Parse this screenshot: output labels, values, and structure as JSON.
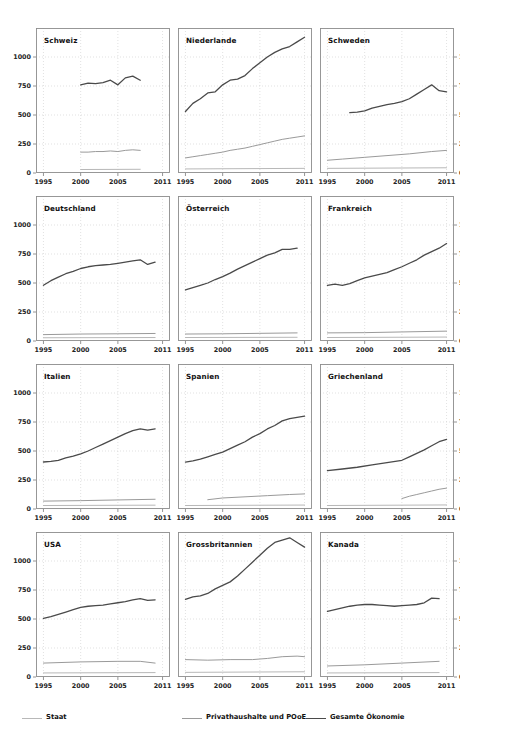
{
  "chart_data": {
    "type": "line",
    "title": "",
    "xlabel": "",
    "ylabel": "",
    "xlim": [
      1994,
      2012
    ],
    "ylim": [
      0,
      1250
    ],
    "xticks": [
      1995,
      2000,
      2005,
      2011
    ],
    "xtick_labels": [
      "1995",
      "2000",
      "2005",
      "2011"
    ],
    "yticks": [
      0,
      250,
      500,
      750,
      1000
    ],
    "ytick_labels": [
      "0",
      "250",
      "500",
      "750",
      "1000"
    ],
    "grid": true,
    "legend_position": "bottom",
    "series_names": [
      "Staat",
      "Privathaushalte und POoE",
      "Gesamte Ökonomie"
    ],
    "series_colors": [
      "#b8b8b8",
      "#9a9a9a",
      "#4a4a4a"
    ],
    "panels": [
      {
        "title": "Schweiz",
        "row": 0,
        "col": 0,
        "y_axis": "left",
        "series": [
          {
            "name": "Gesamte Ökonomie",
            "x": [
              2000,
              2001,
              2002,
              2003,
              2004,
              2005,
              2006,
              2007,
              2008
            ],
            "y": [
              760,
              775,
              770,
              780,
              800,
              760,
              820,
              835,
              800
            ]
          },
          {
            "name": "Privathaushalte und POoE",
            "x": [
              2000,
              2001,
              2002,
              2003,
              2004,
              2005,
              2006,
              2007,
              2008
            ],
            "y": [
              180,
              180,
              185,
              185,
              190,
              185,
              195,
              200,
              195
            ]
          },
          {
            "name": "Staat",
            "x": [
              2000,
              2008
            ],
            "y": [
              30,
              32
            ]
          }
        ]
      },
      {
        "title": "Niederlande",
        "row": 0,
        "col": 1,
        "y_axis": "none",
        "series": [
          {
            "name": "Gesamte Ökonomie",
            "x": [
              1995,
              1996,
              1997,
              1998,
              1999,
              2000,
              2001,
              2002,
              2003,
              2004,
              2005,
              2006,
              2007,
              2008,
              2009,
              2010,
              2011
            ],
            "y": [
              530,
              600,
              640,
              690,
              700,
              760,
              800,
              810,
              840,
              900,
              950,
              1000,
              1040,
              1070,
              1090,
              1130,
              1170
            ]
          },
          {
            "name": "Privathaushalte und POoE",
            "x": [
              1995,
              1996,
              1997,
              1998,
              1999,
              2000,
              2001,
              2002,
              2003,
              2004,
              2005,
              2006,
              2007,
              2008,
              2009,
              2010,
              2011
            ],
            "y": [
              130,
              140,
              150,
              160,
              170,
              180,
              195,
              205,
              215,
              230,
              245,
              260,
              275,
              290,
              300,
              310,
              320
            ]
          },
          {
            "name": "Staat",
            "x": [
              1995,
              2011
            ],
            "y": [
              35,
              40
            ]
          }
        ]
      },
      {
        "title": "Schweden",
        "row": 0,
        "col": 2,
        "y_axis": "right",
        "series": [
          {
            "name": "Gesamte Ökonomie",
            "x": [
              1998,
              1999,
              2000,
              2001,
              2002,
              2003,
              2004,
              2005,
              2006,
              2007,
              2008,
              2009,
              2010,
              2011
            ],
            "y": [
              520,
              525,
              535,
              560,
              575,
              590,
              600,
              615,
              640,
              680,
              720,
              760,
              710,
              700
            ]
          },
          {
            "name": "Privathaushalte und POoE",
            "x": [
              1995,
              1997,
              2000,
              2003,
              2006,
              2009,
              2011
            ],
            "y": [
              110,
              120,
              135,
              150,
              165,
              185,
              195
            ]
          },
          {
            "name": "Staat",
            "x": [
              1995,
              2011
            ],
            "y": [
              40,
              45
            ]
          }
        ]
      },
      {
        "title": "Deutschland",
        "row": 1,
        "col": 0,
        "y_axis": "left",
        "series": [
          {
            "name": "Gesamte Ökonomie",
            "x": [
              1995,
              1996,
              1997,
              1998,
              1999,
              2000,
              2001,
              2002,
              2003,
              2004,
              2005,
              2006,
              2007,
              2008,
              2009,
              2010
            ],
            "y": [
              480,
              520,
              550,
              580,
              600,
              625,
              640,
              650,
              655,
              660,
              670,
              680,
              690,
              700,
              660,
              680
            ]
          },
          {
            "name": "Privathaushalte und POoE",
            "x": [
              1995,
              2000,
              2005,
              2010
            ],
            "y": [
              55,
              60,
              62,
              65
            ]
          },
          {
            "name": "Staat",
            "x": [
              1995,
              2010
            ],
            "y": [
              28,
              30
            ]
          }
        ]
      },
      {
        "title": "Österreich",
        "row": 1,
        "col": 1,
        "y_axis": "none",
        "series": [
          {
            "name": "Gesamte Ökonomie",
            "x": [
              1995,
              1996,
              1997,
              1998,
              1999,
              2000,
              2001,
              2002,
              2003,
              2004,
              2005,
              2006,
              2007,
              2008,
              2009,
              2010
            ],
            "y": [
              440,
              460,
              480,
              500,
              530,
              555,
              585,
              620,
              650,
              680,
              710,
              740,
              760,
              790,
              790,
              800
            ]
          },
          {
            "name": "Privathaushalte und POoE",
            "x": [
              1995,
              2000,
              2005,
              2010
            ],
            "y": [
              60,
              62,
              66,
              70
            ]
          },
          {
            "name": "Staat",
            "x": [
              1995,
              2010
            ],
            "y": [
              30,
              32
            ]
          }
        ]
      },
      {
        "title": "Frankreich",
        "row": 1,
        "col": 2,
        "y_axis": "right",
        "series": [
          {
            "name": "Gesamte Ökonomie",
            "x": [
              1995,
              1996,
              1997,
              1998,
              1999,
              2000,
              2001,
              2002,
              2003,
              2004,
              2005,
              2006,
              2007,
              2008,
              2009,
              2010,
              2011
            ],
            "y": [
              480,
              490,
              480,
              495,
              520,
              545,
              560,
              575,
              590,
              615,
              640,
              670,
              700,
              740,
              770,
              800,
              840
            ]
          },
          {
            "name": "Privathaushalte und POoE",
            "x": [
              1995,
              2000,
              2005,
              2011
            ],
            "y": [
              70,
              72,
              78,
              85
            ]
          },
          {
            "name": "Staat",
            "x": [
              1995,
              2011
            ],
            "y": [
              30,
              34
            ]
          }
        ]
      },
      {
        "title": "Italien",
        "row": 2,
        "col": 0,
        "y_axis": "left",
        "series": [
          {
            "name": "Gesamte Ökonomie",
            "x": [
              1995,
              1996,
              1997,
              1998,
              1999,
              2000,
              2001,
              2002,
              2003,
              2004,
              2005,
              2006,
              2007,
              2008,
              2009,
              2010
            ],
            "y": [
              405,
              410,
              420,
              440,
              455,
              475,
              500,
              530,
              560,
              590,
              620,
              650,
              675,
              690,
              680,
              690
            ]
          },
          {
            "name": "Privathaushalte und POoE",
            "x": [
              1995,
              2000,
              2005,
              2010
            ],
            "y": [
              68,
              72,
              78,
              84
            ]
          },
          {
            "name": "Staat",
            "x": [
              1995,
              2010
            ],
            "y": [
              30,
              33
            ]
          }
        ]
      },
      {
        "title": "Spanien",
        "row": 2,
        "col": 1,
        "y_axis": "none",
        "series": [
          {
            "name": "Gesamte Ökonomie",
            "x": [
              1995,
              1996,
              1997,
              1998,
              1999,
              2000,
              2001,
              2002,
              2003,
              2004,
              2005,
              2006,
              2007,
              2008,
              2009,
              2010,
              2011
            ],
            "y": [
              405,
              415,
              430,
              450,
              470,
              490,
              520,
              550,
              580,
              620,
              650,
              690,
              720,
              760,
              780,
              790,
              800
            ]
          },
          {
            "name": "Privathaushalte und POoE",
            "x": [
              1998,
              2000,
              2003,
              2006,
              2009,
              2011
            ],
            "y": [
              80,
              95,
              105,
              115,
              125,
              130
            ]
          },
          {
            "name": "Staat",
            "x": [
              1995,
              2011
            ],
            "y": [
              30,
              34
            ]
          }
        ]
      },
      {
        "title": "Griechenland",
        "row": 2,
        "col": 2,
        "y_axis": "right",
        "series": [
          {
            "name": "Gesamte Ökonomie",
            "x": [
              1995,
              1997,
              1999,
              2001,
              2003,
              2005,
              2006,
              2007,
              2008,
              2009,
              2010,
              2011
            ],
            "y": [
              330,
              345,
              360,
              380,
              400,
              420,
              450,
              480,
              510,
              545,
              580,
              600
            ]
          },
          {
            "name": "Privathaushalte und POoE",
            "x": [
              2005,
              2006,
              2007,
              2008,
              2009,
              2010,
              2011
            ],
            "y": [
              90,
              110,
              125,
              140,
              155,
              170,
              180
            ]
          },
          {
            "name": "Staat",
            "x": [
              1995,
              2011
            ],
            "y": [
              30,
              35
            ]
          }
        ]
      },
      {
        "title": "USA",
        "row": 3,
        "col": 0,
        "y_axis": "left",
        "series": [
          {
            "name": "Gesamte Ökonomie",
            "x": [
              1995,
              1996,
              1997,
              1998,
              1999,
              2000,
              2001,
              2002,
              2003,
              2004,
              2005,
              2006,
              2007,
              2008,
              2009,
              2010
            ],
            "y": [
              505,
              520,
              540,
              560,
              580,
              600,
              610,
              615,
              620,
              630,
              640,
              650,
              665,
              675,
              660,
              665
            ]
          },
          {
            "name": "Privathaushalte und POoE",
            "x": [
              1995,
              2000,
              2005,
              2008,
              2010
            ],
            "y": [
              120,
              130,
              135,
              135,
              120
            ]
          },
          {
            "name": "Staat",
            "x": [
              1995,
              2010
            ],
            "y": [
              35,
              38
            ]
          }
        ]
      },
      {
        "title": "Grossbritannien",
        "row": 3,
        "col": 1,
        "y_axis": "none",
        "series": [
          {
            "name": "Gesamte Ökonomie",
            "x": [
              1995,
              1996,
              1997,
              1998,
              1999,
              2000,
              2001,
              2002,
              2003,
              2004,
              2005,
              2006,
              2007,
              2008,
              2009,
              2010,
              2011
            ],
            "y": [
              670,
              690,
              700,
              720,
              760,
              790,
              820,
              870,
              930,
              990,
              1050,
              1110,
              1160,
              1180,
              1200,
              1160,
              1120
            ]
          },
          {
            "name": "Privathaushalte und POoE",
            "x": [
              1995,
              1998,
              2001,
              2004,
              2006,
              2008,
              2010,
              2011
            ],
            "y": [
              150,
              145,
              150,
              150,
              160,
              175,
              180,
              175
            ]
          },
          {
            "name": "Staat",
            "x": [
              1995,
              2011
            ],
            "y": [
              40,
              45
            ]
          }
        ]
      },
      {
        "title": "Kanada",
        "row": 3,
        "col": 2,
        "y_axis": "right",
        "series": [
          {
            "name": "Gesamte Ökonomie",
            "x": [
              1995,
              1996,
              1997,
              1998,
              1999,
              2000,
              2001,
              2002,
              2003,
              2004,
              2005,
              2006,
              2007,
              2008,
              2009,
              2010
            ],
            "y": [
              565,
              580,
              595,
              610,
              620,
              625,
              625,
              620,
              615,
              610,
              615,
              620,
              625,
              640,
              680,
              675
            ]
          },
          {
            "name": "Privathaushalte und POoE",
            "x": [
              1995,
              2000,
              2005,
              2010
            ],
            "y": [
              95,
              105,
              120,
              135
            ]
          },
          {
            "name": "Staat",
            "x": [
              1995,
              2010
            ],
            "y": [
              35,
              38
            ]
          }
        ]
      }
    ]
  },
  "legend": {
    "items": [
      {
        "label": "Staat",
        "color": "#b8b8b8"
      },
      {
        "label": "Privathaushalte und POoE",
        "color": "#9a9a9a"
      },
      {
        "label": "Gesamte Ökonomie",
        "color": "#4a4a4a"
      }
    ]
  }
}
